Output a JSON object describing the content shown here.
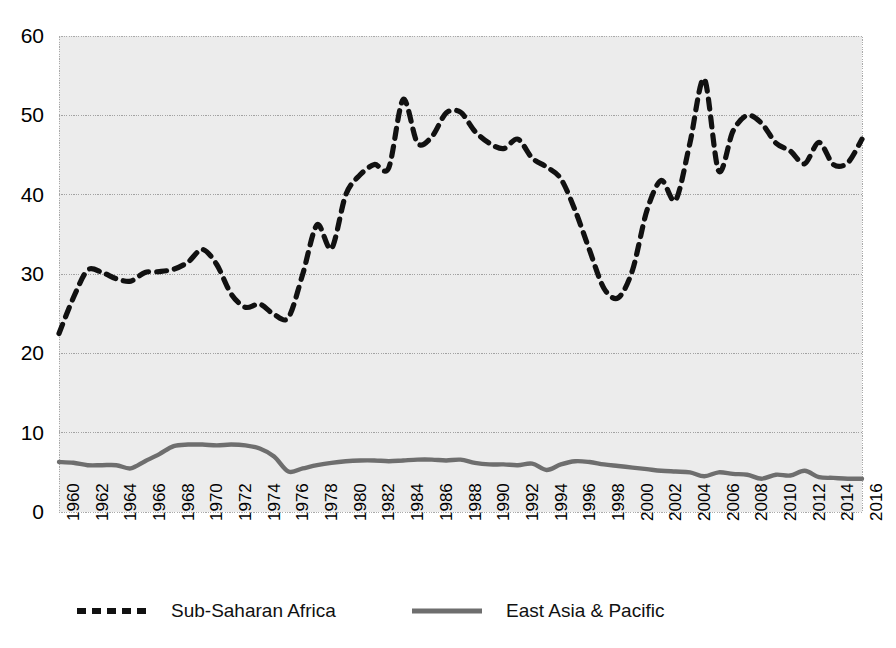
{
  "chart_data": {
    "type": "line",
    "title": "",
    "xlabel": "",
    "ylabel": "",
    "xlim": [
      1960,
      2016
    ],
    "ylim": [
      0,
      60
    ],
    "grid": true,
    "grid_axis": "y",
    "legend_position": "bottom",
    "x": [
      1960,
      1961,
      1962,
      1963,
      1964,
      1965,
      1966,
      1967,
      1968,
      1969,
      1970,
      1971,
      1972,
      1973,
      1974,
      1975,
      1976,
      1977,
      1978,
      1979,
      1980,
      1981,
      1982,
      1983,
      1984,
      1985,
      1986,
      1987,
      1988,
      1989,
      1990,
      1991,
      1992,
      1993,
      1994,
      1995,
      1996,
      1997,
      1998,
      1999,
      2000,
      2001,
      2002,
      2003,
      2004,
      2005,
      2006,
      2007,
      2008,
      2009,
      2010,
      2011,
      2012,
      2013,
      2014,
      2015,
      2016
    ],
    "y_ticks": [
      0,
      10,
      20,
      30,
      40,
      50,
      60
    ],
    "x_ticks": [
      1960,
      1962,
      1964,
      1966,
      1968,
      1970,
      1972,
      1974,
      1976,
      1978,
      1980,
      1982,
      1984,
      1986,
      1988,
      1990,
      1992,
      1994,
      1996,
      1998,
      2000,
      2002,
      2004,
      2006,
      2008,
      2010,
      2012,
      2014,
      2016
    ],
    "series": [
      {
        "name": "Sub-Saharan Africa",
        "color": "#111111",
        "style": "dashed",
        "values": [
          22.5,
          27.0,
          30.5,
          30.2,
          29.4,
          29.1,
          30.2,
          30.3,
          30.6,
          31.5,
          33.1,
          31.2,
          27.5,
          25.8,
          26.2,
          24.9,
          24.5,
          30.0,
          36.2,
          33.2,
          40.0,
          42.5,
          43.8,
          43.4,
          52.0,
          46.5,
          47.3,
          50.3,
          50.4,
          48.0,
          46.5,
          45.8,
          47.0,
          44.6,
          43.5,
          42.0,
          38.0,
          33.0,
          28.2,
          27.0,
          30.5,
          38.0,
          41.8,
          39.3,
          46.5,
          54.6,
          43.0,
          48.0,
          50.0,
          49.0,
          46.5,
          45.5,
          43.9,
          46.6,
          43.8,
          44.0,
          47.0
        ]
      },
      {
        "name": "East Asia & Pacific",
        "color": "#6e6e6e",
        "style": "solid",
        "values": [
          6.3,
          6.2,
          5.9,
          5.9,
          5.9,
          5.5,
          6.4,
          7.3,
          8.3,
          8.5,
          8.5,
          8.4,
          8.5,
          8.4,
          8.0,
          7.0,
          5.1,
          5.5,
          5.9,
          6.2,
          6.4,
          6.5,
          6.5,
          6.4,
          6.5,
          6.6,
          6.6,
          6.5,
          6.6,
          6.2,
          6.0,
          6.0,
          5.9,
          6.1,
          5.3,
          6.0,
          6.4,
          6.3,
          6.0,
          5.8,
          5.6,
          5.4,
          5.2,
          5.1,
          5.0,
          4.5,
          5.0,
          4.8,
          4.7,
          4.2,
          4.7,
          4.6,
          5.2,
          4.4,
          4.3,
          4.2,
          4.2
        ]
      }
    ]
  },
  "axes": {
    "y_tick_labels": [
      "0",
      "10",
      "20",
      "30",
      "40",
      "50",
      "60"
    ],
    "x_tick_labels": [
      "1960",
      "1962",
      "1964",
      "1966",
      "1968",
      "1970",
      "1972",
      "1974",
      "1976",
      "1978",
      "1980",
      "1982",
      "1984",
      "1986",
      "1988",
      "1990",
      "1992",
      "1994",
      "1996",
      "1998",
      "2000",
      "2002",
      "2004",
      "2006",
      "2008",
      "2010",
      "2012",
      "2014",
      "2016"
    ]
  },
  "legend": {
    "entries": [
      {
        "label": "Sub-Saharan Africa",
        "icon": "dashed-line-icon"
      },
      {
        "label": "East Asia & Pacific",
        "icon": "solid-line-icon"
      }
    ]
  },
  "style": {
    "plot_background": "#ececec",
    "grid_color": "#9a9a9a",
    "border_color": "#aaaaaa",
    "page_background": "#ffffff"
  }
}
